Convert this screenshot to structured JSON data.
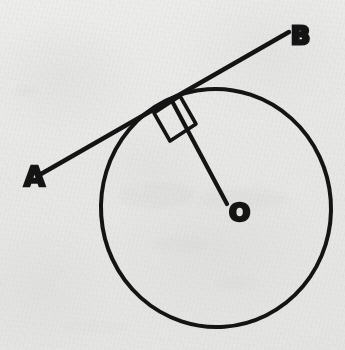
{
  "figure": {
    "kind": "hand-drawn-geometry-diagram",
    "medium": "ink on paper",
    "background_color": "#f4f4f3",
    "ink_color": "#141414"
  },
  "labels": {
    "point_a": "A",
    "point_b": "B",
    "centre_o": "O"
  },
  "geometry": {
    "circle": {
      "name": "circle",
      "center_x": 216,
      "center_y": 208,
      "radius_x": 115,
      "radius_y": 119,
      "stroke_width": 4
    },
    "tangent_line": {
      "name": "tangent-line-ab",
      "x1": 41,
      "y1": 174,
      "x2": 289,
      "y2": 32,
      "stroke_width": 4.4
    },
    "tangent_point": {
      "name": "point-of-tangency",
      "x": 172,
      "y": 100
    },
    "radius_line": {
      "name": "radius-to-tangent-point",
      "x1": 172,
      "y1": 101,
      "x2": 227,
      "y2": 204,
      "stroke_width": 4.2
    },
    "right_angle_marker": {
      "name": "right-angle-square",
      "points": "154,113 180,96 196,124 170,141",
      "stroke_width": 3.6
    },
    "label_positions": {
      "a_x": 24,
      "a_y": 186,
      "b_x": 291,
      "b_y": 44,
      "o_x": 229,
      "o_y": 221
    }
  }
}
